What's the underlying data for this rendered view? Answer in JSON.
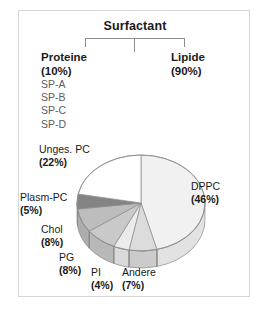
{
  "figure": {
    "tree": {
      "root_label": "Surfactant",
      "branches": [
        {
          "name": "Proteine",
          "percent": "(10%)",
          "children": [
            "SP-A",
            "SP-B",
            "SP-C",
            "SP-D"
          ]
        },
        {
          "name": "Lipide",
          "percent": "(90%)",
          "children": []
        }
      ]
    }
  },
  "chart_data": {
    "type": "pie",
    "title": "Lipide",
    "three_d": true,
    "start_angle_deg": 0,
    "direction": "clockwise",
    "legend": "none-labels-outside",
    "categories": [
      "DPPC",
      "Andere",
      "PI",
      "PG",
      "Chol",
      "Plasm-PC",
      "Unges. PC"
    ],
    "values": [
      46,
      7,
      4,
      8,
      8,
      5,
      22
    ],
    "labels": [
      "DPPC",
      "Andere",
      "PI",
      "PG",
      "Chol",
      "Plasm-PC",
      "Unges. PC"
    ],
    "value_labels": [
      "(46%)",
      "(7%)",
      "(4%)",
      "(8%)",
      "(8%)",
      "(5%)",
      "(22%)"
    ],
    "colors": [
      "#f1f1f1",
      "#dcdcdc",
      "#ebebeb",
      "#c9c9c9",
      "#bdbdbd",
      "#848484",
      "#ffffff"
    ],
    "side_colors": [
      "#e2e2e2",
      "#cbcbcb",
      "#dadada",
      "#b8b8b8",
      "#adadad",
      "#767676",
      "#f0f0f0"
    ],
    "stroke": "#8a8a8a",
    "xlabel": "",
    "ylabel": "",
    "units": "%"
  },
  "pie_labels": [
    {
      "key": "unges",
      "name": "Unges. PC",
      "pct": "(22%)"
    },
    {
      "key": "plasm",
      "name": "Plasm-PC",
      "pct": "(5%)"
    },
    {
      "key": "chol",
      "name": "Chol",
      "pct": "(8%)"
    },
    {
      "key": "pg",
      "name": "PG",
      "pct": "(8%)"
    },
    {
      "key": "pi",
      "name": "PI",
      "pct": "(4%)"
    },
    {
      "key": "andere",
      "name": "Andere",
      "pct": "(7%)"
    },
    {
      "key": "dppc",
      "name": "DPPC",
      "pct": "(46%)"
    }
  ]
}
